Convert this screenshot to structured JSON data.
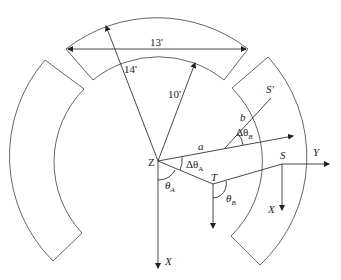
{
  "diagram": {
    "labels": {
      "chord": "13'",
      "outer_radius": "14'",
      "inner_radius": "10'",
      "a": "a",
      "b": "b",
      "s_prime": "S'",
      "s": "S",
      "y": "Y",
      "x_main": "X",
      "x_s": "X",
      "z": "Z",
      "t": "T",
      "delta_theta_a": "Δθ",
      "delta_theta_a_sub": "A",
      "delta_theta_b": "Δθ",
      "delta_theta_b_sub": "B",
      "theta_a": "θ",
      "theta_a_sub": "A",
      "theta_b": "θ",
      "theta_b_sub": "B"
    },
    "segments": [
      "top",
      "left",
      "right"
    ]
  }
}
